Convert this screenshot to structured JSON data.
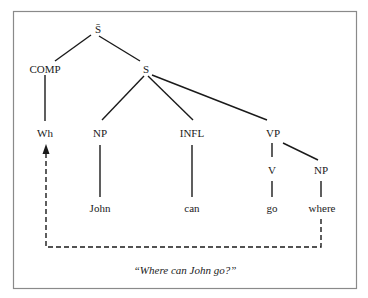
{
  "diagram": {
    "type": "syntax-tree",
    "nodes": {
      "root": "S̄",
      "comp": "COMP",
      "s": "S",
      "wh": "Wh",
      "np_subject": "NP",
      "infl": "INFL",
      "vp": "VP",
      "v": "V",
      "np_object": "NP",
      "john": "John",
      "can": "can",
      "go": "go",
      "where": "where"
    },
    "edges": [
      [
        "S̄",
        "COMP"
      ],
      [
        "S̄",
        "S"
      ],
      [
        "COMP",
        "Wh"
      ],
      [
        "S",
        "NP"
      ],
      [
        "S",
        "INFL"
      ],
      [
        "S",
        "VP"
      ],
      [
        "VP",
        "V"
      ],
      [
        "VP",
        "NP"
      ],
      [
        "NP",
        "John"
      ],
      [
        "INFL",
        "can"
      ],
      [
        "V",
        "go"
      ],
      [
        "NP",
        "where"
      ]
    ],
    "movement_arrow": {
      "from": "where",
      "to": "Wh",
      "style": "dashed"
    },
    "caption": "“Where can John go?”"
  }
}
